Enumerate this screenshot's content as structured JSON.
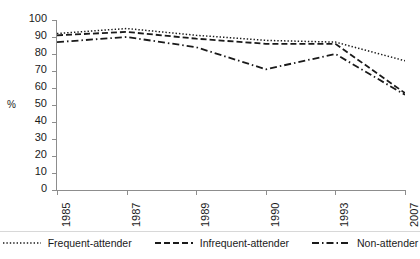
{
  "chart_data": {
    "type": "line",
    "title": "",
    "xlabel": "",
    "ylabel": "%",
    "categories": [
      "1985",
      "1987",
      "1989",
      "1990",
      "1993",
      "2007"
    ],
    "ylim": [
      0,
      100
    ],
    "yticks": [
      0,
      10,
      20,
      30,
      40,
      50,
      60,
      70,
      80,
      90,
      100
    ],
    "grid": false,
    "legend_position": "bottom",
    "series": [
      {
        "name": "Frequent-attender",
        "style": "dotted",
        "color": "#1a1a1a",
        "values": [
          92,
          95,
          91,
          88,
          87,
          76
        ]
      },
      {
        "name": "Infrequent-attender",
        "style": "dashed",
        "color": "#1a1a1a",
        "values": [
          91,
          93,
          89,
          86,
          86,
          57
        ]
      },
      {
        "name": "Non-attender",
        "style": "dash-dot",
        "color": "#1a1a1a",
        "values": [
          87,
          90,
          84,
          71,
          80,
          56
        ]
      }
    ]
  },
  "axis": {
    "y_label": "%",
    "y_ticks": [
      "100",
      "90",
      "80",
      "70",
      "60",
      "50",
      "40",
      "30",
      "20",
      "10",
      "0"
    ],
    "x_ticks": [
      "1985",
      "1987",
      "1989",
      "1990",
      "1993",
      "2007"
    ]
  },
  "legend": {
    "items": [
      {
        "label": "Frequent-attender"
      },
      {
        "label": "Infrequent-attender"
      },
      {
        "label": "Non-attender"
      }
    ]
  }
}
